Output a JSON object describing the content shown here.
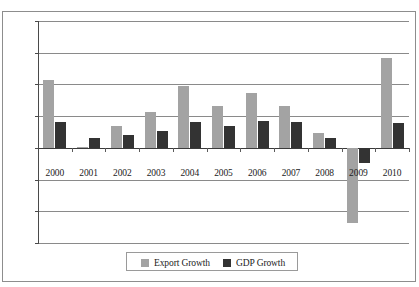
{
  "chart_data": {
    "type": "bar",
    "title": "",
    "subtitle": "",
    "xlabel": "",
    "ylabel": "",
    "categories": [
      "2000",
      "2001",
      "2002",
      "2003",
      "2004",
      "2005",
      "2006",
      "2007",
      "2008",
      "2009",
      "2010"
    ],
    "series": [
      {
        "name": "Export Growth",
        "color": "#a3a3a3",
        "values": [
          10.7,
          0.1,
          3.5,
          5.6,
          9.7,
          6.6,
          8.6,
          6.6,
          2.4,
          -11.9,
          14.2
        ]
      },
      {
        "name": "GDP Growth",
        "color": "#333333",
        "values": [
          4.1,
          1.6,
          2.0,
          2.7,
          4.0,
          3.4,
          4.2,
          4.0,
          1.5,
          -2.4,
          3.9
        ]
      }
    ],
    "ylim": [
      -15.0,
      20.0
    ],
    "yticks": [
      20.0,
      15.0,
      10.0,
      5.0,
      0.0,
      -5.0,
      -10.0,
      -15.0
    ],
    "ytick_labels": [
      "20.0",
      "15.0",
      "10.0",
      "5.0",
      "0.0",
      "−5.0",
      "−10.0",
      "−15.0"
    ],
    "grid": true,
    "legend_position": "bottom"
  },
  "legend": {
    "entries": [
      {
        "label": "Export Growth",
        "swatch_color": "#a3a3a3"
      },
      {
        "label": "GDP Growth",
        "swatch_color": "#333333"
      }
    ]
  },
  "colors": {
    "export_growth": "#a3a3a3",
    "gdp_growth": "#333333",
    "gridline": "#8a8a8a",
    "axis": "#4a4a4a",
    "frame": "#8d8d8d",
    "text": "#1b1b1b",
    "background": "#ffffff"
  }
}
